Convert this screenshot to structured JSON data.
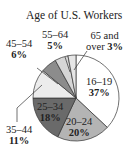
{
  "chart_data": {
    "type": "pie",
    "title": "Age of U.S. Workers",
    "categories": [
      "16–19",
      "20–24",
      "25–34",
      "35–44",
      "45–54",
      "55–64",
      "65 and over"
    ],
    "values": [
      37,
      20,
      18,
      11,
      6,
      5,
      3
    ],
    "unit": "%",
    "colors": [
      "#ffffff",
      "#b4b4b4",
      "#6a6a6a",
      "#ececec",
      "#8c8c8c",
      "#d6d6d6",
      "#e6e6e6"
    ]
  },
  "labels": {
    "a16": {
      "range": "16–19",
      "pct": "37%"
    },
    "a20": {
      "range": "20–24",
      "pct": "20%"
    },
    "a25": {
      "range": "25–34",
      "pct": "18%"
    },
    "a35": {
      "range": "35–44",
      "pct": "11%"
    },
    "a45": {
      "range": "45–54",
      "pct": "6%"
    },
    "a55": {
      "range": "55–64",
      "pct": "5%"
    },
    "a65": {
      "line1": "65 and",
      "line2": "over ",
      "pct": "3%"
    }
  }
}
